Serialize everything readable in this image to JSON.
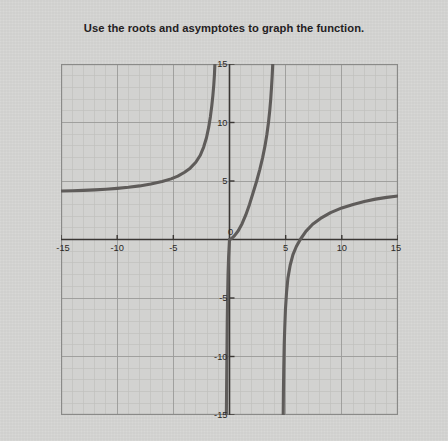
{
  "title": "Use the roots and asymptotes to graph the function.",
  "colors": {
    "paper": "#d4d4d2",
    "plot_background": "#d2d2d0",
    "minor_grid": "#c0c0be",
    "major_grid": "#9a9a98",
    "border": "#8a8a88",
    "axis": "#3a3734",
    "curve": "#5f5c5a",
    "label_text": "#2b2825"
  },
  "axes": {
    "x_label_values": [
      "-15",
      "-10",
      "-5",
      "0",
      "5",
      "10",
      "15"
    ],
    "y_label_values": [
      "15",
      "10",
      "5",
      "-5",
      "-10",
      "-15"
    ],
    "x_tick_numbers": [
      -15,
      -10,
      -5,
      0,
      5,
      10,
      15
    ],
    "y_tick_numbers": [
      15,
      10,
      5,
      -5,
      -10,
      -15
    ],
    "origin_label": "0"
  },
  "chart_data": {
    "type": "line",
    "title": "Use the roots and asymptotes to graph the function.",
    "xlabel": "",
    "ylabel": "",
    "xlim": [
      -15,
      15
    ],
    "ylim": [
      -15,
      15
    ],
    "grid": true,
    "minor_grid_step": 1,
    "major_grid_step": 5,
    "legend": "none",
    "xticks": [
      -15,
      -10,
      -5,
      0,
      5,
      10,
      15
    ],
    "yticks": [
      -15,
      -10,
      -5,
      0,
      5,
      10,
      15
    ],
    "vertical_asymptotes": [
      -1,
      4.7
    ],
    "horizontal_asymptote": 4,
    "roots": [
      0
    ],
    "branches": [
      {
        "name": "left-branch",
        "description": "Comes in from x=-15 at y just above 4, rises slowly then sharply up to y=15 at the vertical asymptote x=-1",
        "points": [
          [
            -15.0,
            4.15
          ],
          [
            -14.0,
            4.17
          ],
          [
            -13.0,
            4.2
          ],
          [
            -12.0,
            4.24
          ],
          [
            -11.0,
            4.3
          ],
          [
            -10.0,
            4.37
          ],
          [
            -9.0,
            4.46
          ],
          [
            -8.0,
            4.58
          ],
          [
            -7.0,
            4.74
          ],
          [
            -6.0,
            4.95
          ],
          [
            -5.2,
            5.18
          ],
          [
            -4.6,
            5.42
          ],
          [
            -4.0,
            5.75
          ],
          [
            -3.5,
            6.1
          ],
          [
            -3.0,
            6.6
          ],
          [
            -2.6,
            7.2
          ],
          [
            -2.3,
            7.9
          ],
          [
            -2.05,
            8.7
          ],
          [
            -1.85,
            9.6
          ],
          [
            -1.7,
            10.5
          ],
          [
            -1.58,
            11.4
          ],
          [
            -1.48,
            12.3
          ],
          [
            -1.4,
            13.2
          ],
          [
            -1.34,
            14.1
          ],
          [
            -1.3,
            15.0
          ]
        ]
      },
      {
        "name": "middle-branch-upper",
        "description": "Steep branch left of second vertical asymptote: from y=15 near x=3.9 curving down through the origin region",
        "points": [
          [
            3.85,
            15.0
          ],
          [
            3.8,
            14.0
          ],
          [
            3.74,
            13.0
          ],
          [
            3.67,
            12.0
          ],
          [
            3.58,
            11.0
          ],
          [
            3.47,
            10.0
          ],
          [
            3.33,
            9.0
          ],
          [
            3.16,
            8.0
          ],
          [
            2.95,
            7.0
          ],
          [
            2.7,
            6.0
          ],
          [
            2.42,
            5.0
          ],
          [
            2.1,
            4.0
          ],
          [
            1.78,
            3.0
          ],
          [
            1.45,
            2.1
          ],
          [
            1.12,
            1.35
          ],
          [
            0.78,
            0.75
          ],
          [
            0.45,
            0.33
          ],
          [
            0.2,
            0.1
          ],
          [
            0.05,
            0.0
          ]
        ]
      },
      {
        "name": "middle-branch-lower",
        "description": "Nearly vertical branch just left of the y-axis going from the origin straight down to y=-15",
        "points": [
          [
            0.0,
            0.0
          ],
          [
            -0.08,
            -1.5
          ],
          [
            -0.13,
            -3.0
          ],
          [
            -0.17,
            -5.0
          ],
          [
            -0.2,
            -7.0
          ],
          [
            -0.22,
            -9.0
          ],
          [
            -0.24,
            -11.0
          ],
          [
            -0.26,
            -13.0
          ],
          [
            -0.28,
            -15.0
          ]
        ]
      },
      {
        "name": "right-branch",
        "description": "From y=-15 at x just above 4.7, rises steeply then flattens to approach y=4 as x goes to 15",
        "points": [
          [
            4.78,
            -15.0
          ],
          [
            4.8,
            -13.0
          ],
          [
            4.83,
            -11.0
          ],
          [
            4.87,
            -9.0
          ],
          [
            4.92,
            -7.5
          ],
          [
            4.98,
            -6.0
          ],
          [
            5.08,
            -4.5
          ],
          [
            5.2,
            -3.3
          ],
          [
            5.4,
            -2.2
          ],
          [
            5.65,
            -1.3
          ],
          [
            5.95,
            -0.6
          ],
          [
            6.3,
            0.0
          ],
          [
            6.8,
            0.7
          ],
          [
            7.4,
            1.3
          ],
          [
            8.1,
            1.8
          ],
          [
            9.0,
            2.3
          ],
          [
            10.0,
            2.7
          ],
          [
            11.0,
            3.0
          ],
          [
            12.0,
            3.25
          ],
          [
            13.0,
            3.45
          ],
          [
            14.0,
            3.6
          ],
          [
            15.0,
            3.72
          ]
        ]
      }
    ]
  }
}
